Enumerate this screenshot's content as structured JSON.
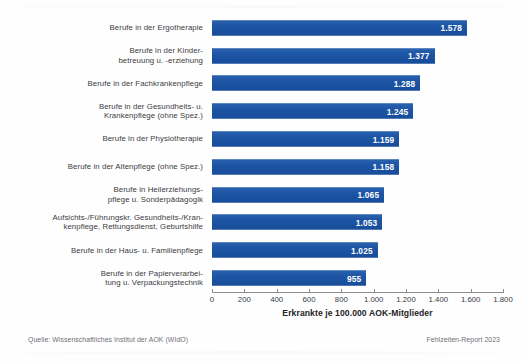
{
  "chart_data": {
    "type": "bar",
    "orientation": "horizontal",
    "title": "",
    "xlabel": "Erkrankte je 100.000 AOK-Mitglieder",
    "ylabel": "",
    "xlim": [
      0,
      1800
    ],
    "xticks": [
      0,
      200,
      400,
      600,
      800,
      1000,
      1200,
      1400,
      1600,
      1800
    ],
    "xtick_labels": [
      "0",
      "200",
      "400",
      "600",
      "800",
      "1.000",
      "1.200",
      "1.400",
      "1.600",
      "1.800"
    ],
    "grid": false,
    "legend": "none",
    "bar_color": "#1d56a5",
    "value_label_color": "#ffffff",
    "categories": [
      "Berufe in der Ergotherapie",
      "Berufe in der Kinder-\nbetreuung u. -erziehung",
      "Berufe in der Fachkrankenpflege",
      "Berufe in der Gesundheits- u.\nKrankenpflege (ohne Spez.)",
      "Berufe in der Physiotherapie",
      "Berufe in der Altenpflege (ohne Spez.)",
      "Berufe in Heilerziehungs-\npflege u. Sonderpädagogik",
      "Aufsichts-/Führungskr. Gesundheits-/Kran-\nkenpflege, Rettungsdienst, Geburtshilfe",
      "Berufe in der Haus- u. Familienpflege",
      "Berufe in der Papierverarbei-\ntung u. Verpackungstechnik"
    ],
    "values": [
      1578,
      1377,
      1288,
      1245,
      1159,
      1158,
      1065,
      1053,
      1025,
      955
    ],
    "value_labels": [
      "1.578",
      "1.377",
      "1.288",
      "1.245",
      "1.159",
      "1.158",
      "1.065",
      "1.053",
      "1.025",
      "955"
    ]
  },
  "footer": {
    "source": "Quelle: Wissenschaftliches Institut der AOK (WIdO)",
    "report": "Fehlzeiten-Report 2023"
  }
}
